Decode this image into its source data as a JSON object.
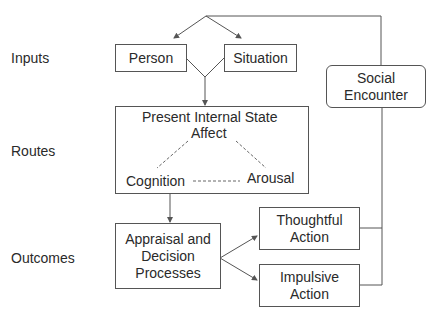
{
  "row_labels": {
    "inputs": "Inputs",
    "routes": "Routes",
    "outcomes": "Outcomes"
  },
  "nodes": {
    "person": "Person",
    "situation": "Situation",
    "social_encounter": {
      "line1": "Social",
      "line2": "Encounter"
    },
    "present_internal_state": {
      "title": "Present Internal State",
      "affect": "Affect",
      "cognition": "Cognition",
      "arousal": "Arousal"
    },
    "appraisal": {
      "line1": "Appraisal and",
      "line2": "Decision",
      "line3": "Processes"
    },
    "thoughtful_action": {
      "line1": "Thoughtful",
      "line2": "Action"
    },
    "impulsive_action": {
      "line1": "Impulsive",
      "line2": "Action"
    }
  },
  "edges": [
    {
      "from": "social_encounter",
      "to": "person",
      "style": "solid-arrow"
    },
    {
      "from": "social_encounter",
      "to": "situation",
      "style": "solid-arrow"
    },
    {
      "from": "person+situation",
      "to": "present_internal_state",
      "style": "solid-arrow"
    },
    {
      "from": "affect",
      "to": "cognition",
      "style": "dashed"
    },
    {
      "from": "affect",
      "to": "arousal",
      "style": "dashed"
    },
    {
      "from": "cognition",
      "to": "arousal",
      "style": "dashed"
    },
    {
      "from": "present_internal_state",
      "to": "appraisal",
      "style": "solid-arrow"
    },
    {
      "from": "appraisal",
      "to": "thoughtful_action",
      "style": "solid-arrow"
    },
    {
      "from": "appraisal",
      "to": "impulsive_action",
      "style": "solid-arrow"
    },
    {
      "from": "thoughtful_action",
      "to": "social_encounter",
      "style": "solid"
    },
    {
      "from": "impulsive_action",
      "to": "social_encounter",
      "style": "solid"
    }
  ],
  "colors": {
    "line": "#555555",
    "text": "#2a2a2a",
    "background": "#ffffff"
  }
}
